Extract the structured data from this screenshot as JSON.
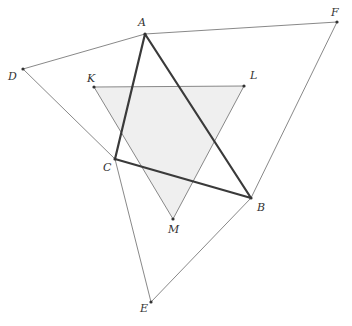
{
  "diagram": {
    "colors": {
      "background": "#ffffff",
      "thin_line": "#7a7a7a",
      "thick_line": "#3a3a3a",
      "shade": "#efefef",
      "point": "#333333",
      "label": "#333333"
    },
    "points": {
      "A": {
        "x": 145,
        "y": 34,
        "label": "A",
        "lx": 138,
        "ly": 26
      },
      "B": {
        "x": 251,
        "y": 198,
        "label": "B",
        "lx": 257,
        "ly": 211
      },
      "C": {
        "x": 115,
        "y": 159,
        "label": "C",
        "lx": 103,
        "ly": 171
      },
      "D": {
        "x": 23,
        "y": 69,
        "label": "D",
        "lx": 8,
        "ly": 80
      },
      "E": {
        "x": 151,
        "y": 302,
        "label": "E",
        "lx": 140,
        "ly": 312
      },
      "F": {
        "x": 337,
        "y": 22,
        "label": "F",
        "lx": 331,
        "ly": 16
      },
      "K": {
        "x": 94,
        "y": 87,
        "label": "K",
        "lx": 87,
        "ly": 82
      },
      "L": {
        "x": 244,
        "y": 86,
        "label": "L",
        "lx": 250,
        "ly": 79
      },
      "M": {
        "x": 173,
        "y": 219,
        "label": "M",
        "lx": 168,
        "ly": 233
      }
    },
    "triangles": [
      {
        "name": "ABC",
        "vertices": [
          "A",
          "B",
          "C"
        ],
        "style": "thick"
      },
      {
        "name": "KLM",
        "vertices": [
          "K",
          "L",
          "M"
        ],
        "style": "thin",
        "fill": "shade"
      }
    ],
    "segments": [
      {
        "from": "D",
        "to": "A"
      },
      {
        "from": "D",
        "to": "C"
      },
      {
        "from": "A",
        "to": "F"
      },
      {
        "from": "F",
        "to": "B"
      },
      {
        "from": "C",
        "to": "E"
      },
      {
        "from": "E",
        "to": "B"
      }
    ]
  }
}
